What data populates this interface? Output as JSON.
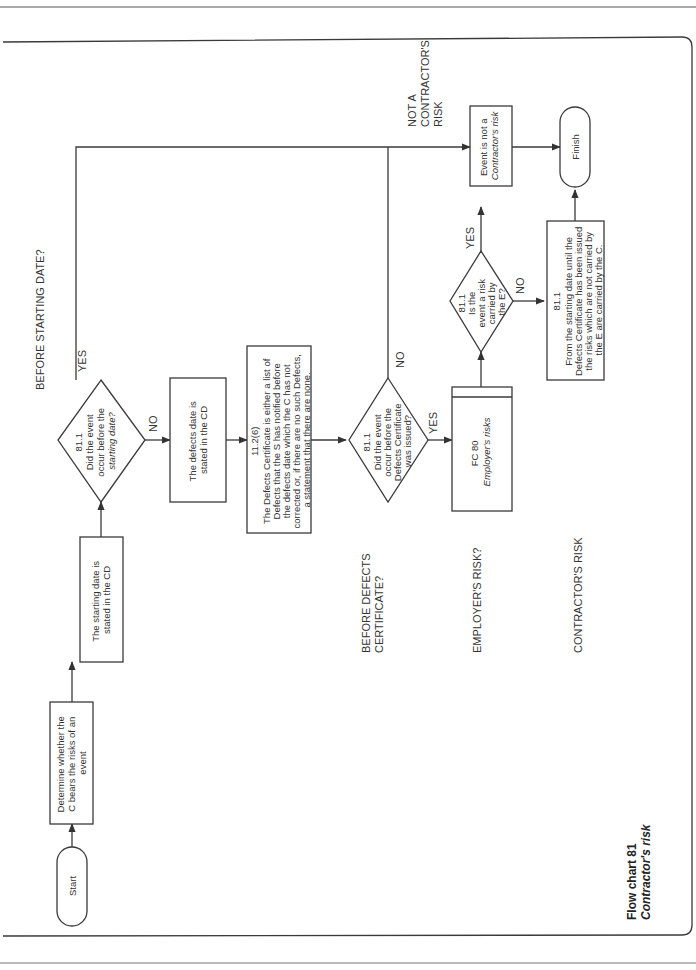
{
  "caption": {
    "line1": "Flow chart 81",
    "line2": "Contractor's risk"
  },
  "lanes": {
    "before_starting_date": "BEFORE STARTING DATE?",
    "before_defects_line1": "BEFORE DEFECTS",
    "before_defects_line2": "CERTIFICATE?",
    "employers_risk": "EMPLOYER'S RISK?",
    "contractors_risk": "CONTRACTOR'S RISK",
    "not_contractors_line1": "NOT A",
    "not_contractors_line2": "CONTRACTOR'S",
    "not_contractors_line3": "RISK"
  },
  "nodes": {
    "start": "Start",
    "determine": [
      "Determine whether the",
      "C bears the risks of an",
      "event"
    ],
    "starting_date": [
      "The starting date is",
      "stated in the CD"
    ],
    "decision1": [
      "81.1",
      "Did the event",
      "occur before the",
      "starting date?"
    ],
    "defects_date": [
      "The defects date is",
      "stated in the CD"
    ],
    "defects_cert": [
      "11.2(6)",
      "The Defects Certificate is either a list of",
      "Defects that the S has notified before",
      "the defects date which the C has not",
      "corrected or, if there are no such Defects,",
      "a statement that there are none."
    ],
    "decision2": [
      "81.1",
      "Did the event",
      "occur before the",
      "Defects Certificate",
      "was issued?"
    ],
    "fc80": [
      "FC 80",
      "Employer's risks"
    ],
    "decision3": [
      "81.1",
      "Is the",
      "event a risk",
      "carried by",
      "the E?"
    ],
    "not_risk": [
      "Event is not a",
      "Contractor's risk"
    ],
    "contractor_risks": [
      "81.1",
      "From the starting date until the",
      "Defects Certificate has been issued",
      "the risks which are not carried by",
      "the E are carried by the C."
    ],
    "finish": "Finish"
  },
  "edge_labels": {
    "yes": "YES",
    "no": "NO"
  }
}
